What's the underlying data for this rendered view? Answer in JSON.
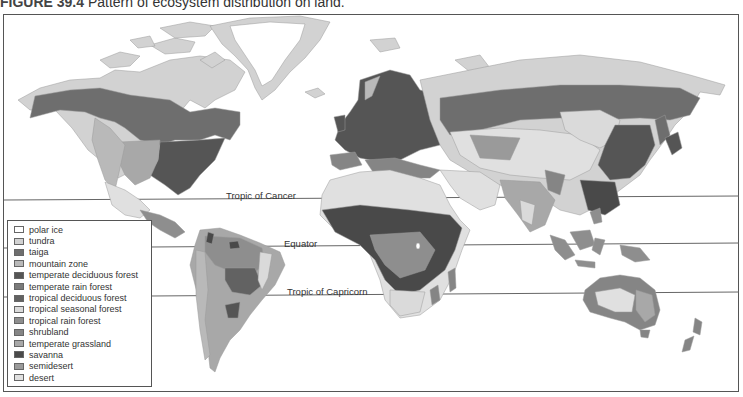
{
  "figure": {
    "number": "FIGURE 39.4",
    "title": "Pattern of ecosystem distribution on land."
  },
  "reference_lines": {
    "tropic_of_cancer": "Tropic of Cancer",
    "equator": "Equator",
    "tropic_of_capricorn": "Tropic of Capricorn"
  },
  "legend": {
    "items": [
      {
        "label": "polar ice",
        "color": "#ffffff"
      },
      {
        "label": "tundra",
        "color": "#d2d2d2"
      },
      {
        "label": "taiga",
        "color": "#6e6e6e"
      },
      {
        "label": "mountain zone",
        "color": "#b9b9b9"
      },
      {
        "label": "temperate deciduous forest",
        "color": "#555555"
      },
      {
        "label": "temperate rain forest",
        "color": "#7a7a7a"
      },
      {
        "label": "tropical deciduous forest",
        "color": "#626262"
      },
      {
        "label": "tropical seasonal forest",
        "color": "#dadada"
      },
      {
        "label": "tropical rain forest",
        "color": "#8e8e8e"
      },
      {
        "label": "shrubland",
        "color": "#858585"
      },
      {
        "label": "temperate grassland",
        "color": "#a8a8a8"
      },
      {
        "label": "savanna",
        "color": "#4a4a4a"
      },
      {
        "label": "semidesert",
        "color": "#9a9a9a"
      },
      {
        "label": "desert",
        "color": "#e0e0e0"
      }
    ]
  }
}
